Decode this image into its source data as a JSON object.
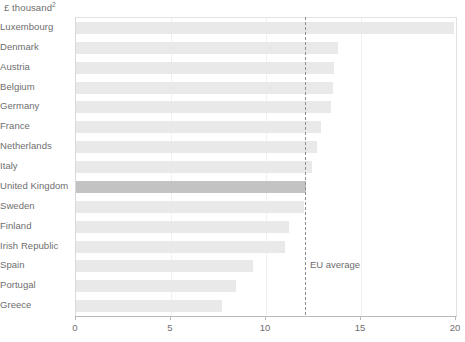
{
  "chart_data": {
    "type": "bar",
    "orientation": "horizontal",
    "title": "",
    "subtitle": "",
    "units_label": "£ thousand",
    "units_footnote": "2",
    "xlabel": "",
    "ylabel": "",
    "xlim": [
      0,
      20
    ],
    "xticks": [
      0,
      5,
      10,
      15,
      20
    ],
    "xtick_labels": [
      "0",
      "5",
      "10",
      "15",
      "20"
    ],
    "grid": true,
    "grid_axis": "x",
    "legend": "none",
    "categories": [
      "Luxembourg",
      "Denmark",
      "Austria",
      "Belgium",
      "Germany",
      "France",
      "Netherlands",
      "Italy",
      "United Kingdom",
      "Sweden",
      "Finland",
      "Irish Republic",
      "Spain",
      "Portugal",
      "Greece"
    ],
    "values": [
      19.9,
      13.8,
      13.6,
      13.5,
      13.4,
      12.9,
      12.7,
      12.4,
      12.1,
      12.0,
      11.2,
      11.0,
      9.3,
      8.4,
      7.7
    ],
    "highlight_category": "United Kingdom",
    "annotations": [
      {
        "name": "eu-average",
        "label": "EU average",
        "value": 12.1,
        "style": "dashed-vertical-line"
      }
    ],
    "colors": {
      "bar": "#e9e9e9",
      "bar_highlight": "#c3c3c3",
      "gridline": "#f0f0f0",
      "axis": "#b9b9b9",
      "annotation_line": "#8f8f8f",
      "text": "#6e6e6e",
      "background": "#ffffff"
    }
  }
}
